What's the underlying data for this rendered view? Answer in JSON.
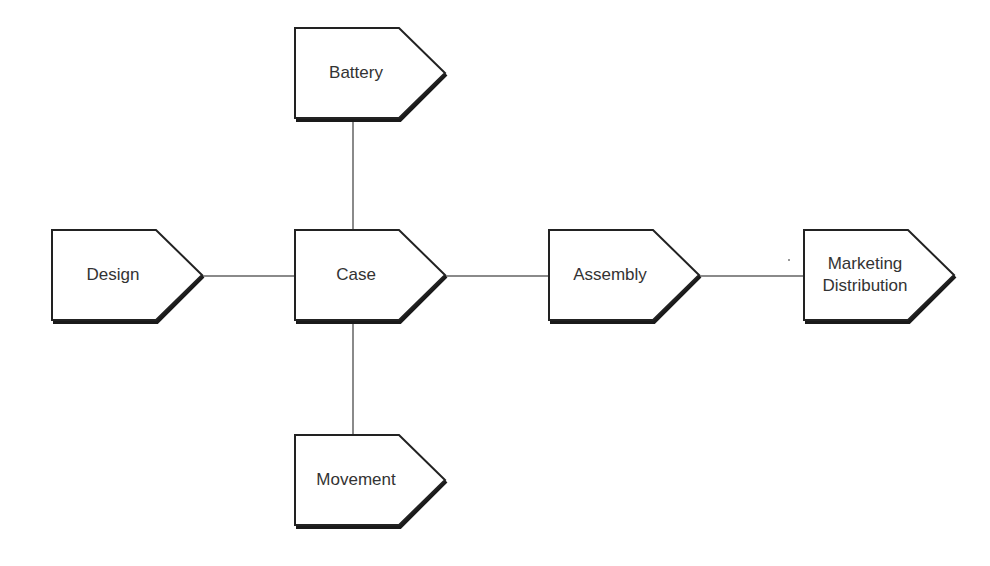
{
  "diagram": {
    "type": "flow",
    "colors": {
      "stroke": "#222222",
      "shadow": "#1a1a1a",
      "connector": "#888888",
      "fill": "#ffffff",
      "text": "#333333"
    },
    "nodes": [
      {
        "id": "battery",
        "label": "Battery",
        "x": 295,
        "y": 28,
        "w": 150,
        "h": 90
      },
      {
        "id": "design",
        "label": "Design",
        "x": 52,
        "y": 230,
        "w": 150,
        "h": 90
      },
      {
        "id": "case",
        "label": "Case",
        "x": 295,
        "y": 230,
        "w": 150,
        "h": 90
      },
      {
        "id": "assembly",
        "label": "Assembly",
        "x": 549,
        "y": 230,
        "w": 150,
        "h": 90
      },
      {
        "id": "marketing",
        "label": "Marketing",
        "label2": "Distribution",
        "x": 804,
        "y": 230,
        "w": 150,
        "h": 90
      },
      {
        "id": "movement",
        "label": "Movement",
        "x": 295,
        "y": 435,
        "w": 150,
        "h": 90
      }
    ],
    "edges": [
      {
        "from": "battery",
        "to": "case"
      },
      {
        "from": "design",
        "to": "case"
      },
      {
        "from": "case",
        "to": "assembly"
      },
      {
        "from": "assembly",
        "to": "marketing"
      },
      {
        "from": "case",
        "to": "movement"
      }
    ]
  }
}
